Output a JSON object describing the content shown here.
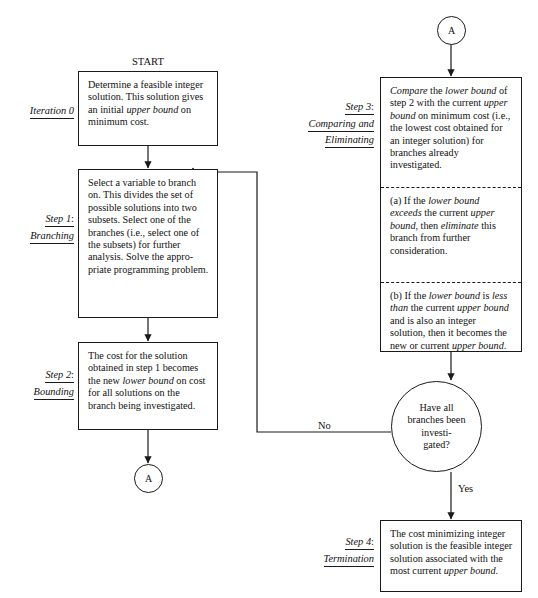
{
  "labels": {
    "start": "START",
    "no": "No",
    "yes": "Yes",
    "connector_a_top": "A",
    "connector_a_bottom": "A"
  },
  "steps": {
    "iteration0": {
      "name_line1": "Iteration 0",
      "name_line2": "",
      "body": "Determine a feasible integer solution.  This solution gives an initial upper bound on minimum cost."
    },
    "step1": {
      "name_line1": "Step 1",
      "colon": ":",
      "name_line2": "Branching",
      "body": "Select a variable to branch on.  This divides the set of possible solutions into two subsets.  Select one of the branches (i.e., select one of the subsets) for further analysis.  Solve the appro-priate programming problem."
    },
    "step2": {
      "name_line1": "Step 2",
      "colon": ":",
      "name_line2": "Bounding",
      "body": "The cost for the solution obtained in step 1 becomes the new lower bound on cost for all solutions on the branch being investigated."
    },
    "step3": {
      "name_line1": "Step 3",
      "colon": ":",
      "name_line2": "Comparing and",
      "name_line3": "Eliminating",
      "body_main": "Compare the lower bound of step 2 with the current upper bound on minimum cost (i.e., the lowest cost obtained for an integer solution) for branches already investigated.",
      "body_a": "(a)  If the lower bound exceeds the current upper bound, then eliminate this branch from further consideration.",
      "body_b": "(b)  If the lower bound is less than the current upper bound and is also an integer solution, then it becomes the new or current upper bound."
    },
    "step4": {
      "name_line1": "Step 4",
      "colon": ":",
      "name_line2": "Termination",
      "body": "The cost minimizing integer solution is the feasible integer solution associated with the most current upper bound."
    }
  },
  "decision": {
    "text": "Have all\nbranches been\ninvesti-\ngated?"
  },
  "colors": {
    "line": "#1a1a1a",
    "background": "#ffffff",
    "text": "#111111"
  }
}
